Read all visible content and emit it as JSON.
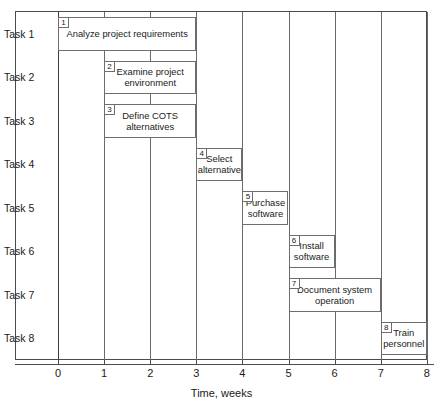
{
  "chart_data": {
    "type": "bar",
    "chart_kind": "gantt",
    "title": "",
    "xlabel": "Time, weeks",
    "ylabel": "",
    "xlim": [
      0,
      8
    ],
    "xticks": [
      0,
      1,
      2,
      3,
      4,
      5,
      6,
      7,
      8
    ],
    "xtick_labels": [
      "0",
      "1",
      "2",
      "3",
      "4",
      "5",
      "6",
      "7",
      "8"
    ],
    "grid": true,
    "grid_axis": "x",
    "legend": "none",
    "categories": [
      "Task 1",
      "Task 2",
      "Task 3",
      "Task 4",
      "Task 5",
      "Task 6",
      "Task 7",
      "Task 8"
    ],
    "tasks": [
      {
        "id": "1",
        "row": "Task 1",
        "label": "Analyze project requirements",
        "start": 0,
        "end": 3,
        "duration": 3
      },
      {
        "id": "2",
        "row": "Task 2",
        "label": "Examine project environment",
        "start": 1,
        "end": 3,
        "duration": 2
      },
      {
        "id": "3",
        "row": "Task 3",
        "label": "Define COTS alternatives",
        "start": 1,
        "end": 3,
        "duration": 2
      },
      {
        "id": "4",
        "row": "Task 4",
        "label": "Select alternative",
        "start": 3,
        "end": 4,
        "duration": 1
      },
      {
        "id": "5",
        "row": "Task 5",
        "label": "Purchase software",
        "start": 4,
        "end": 5,
        "duration": 1
      },
      {
        "id": "6",
        "row": "Task 6",
        "label": "Install software",
        "start": 5,
        "end": 6,
        "duration": 1
      },
      {
        "id": "7",
        "row": "Task 7",
        "label": "Document system operation",
        "start": 5,
        "end": 7,
        "duration": 2
      },
      {
        "id": "8",
        "row": "Task 8",
        "label": "Train personnel",
        "start": 7,
        "end": 8,
        "duration": 1
      }
    ]
  },
  "colors": {
    "background": "#ffffff",
    "frame": "#4a4a4a",
    "gridline": "#6a6a6a",
    "bar_border": "#6e6e6e",
    "bar_fill": "#ffffff",
    "text": "#1a1a1a"
  }
}
